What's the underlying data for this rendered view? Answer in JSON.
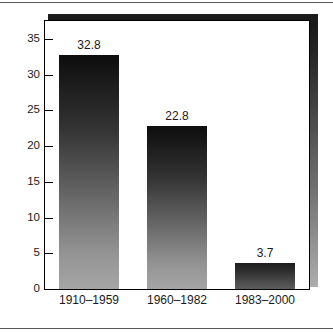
{
  "chart_data": {
    "type": "bar",
    "title": "",
    "subtitle": "",
    "xlabel": "",
    "ylabel": "",
    "categories": [
      "1910–1959",
      "1960–1982",
      "1983–2000"
    ],
    "values": [
      32.8,
      22.8,
      3.7
    ],
    "value_labels": [
      "32.8",
      "22.8",
      "3.7"
    ],
    "ylim": [
      0,
      37.5
    ],
    "yticks": [
      0,
      5,
      10,
      15,
      20,
      25,
      30,
      35
    ],
    "ytick_labels": [
      "0",
      "5",
      "10",
      "15",
      "20",
      "25",
      "30",
      "35"
    ],
    "grid": false,
    "legend": false,
    "legend_position": "none",
    "series": [
      {
        "name": "",
        "values": [
          32.8,
          22.8,
          3.7
        ]
      }
    ],
    "colors": {
      "bar_top": "#0d0d0d",
      "bar_bottom": "#a5a5a5",
      "axis": "#000000",
      "text": "#1a1a1a",
      "background": "#ffffff",
      "shadow_top": "#1b1b1b",
      "shadow_bottom": "#adadad",
      "rule": "#5a5a5a"
    }
  }
}
